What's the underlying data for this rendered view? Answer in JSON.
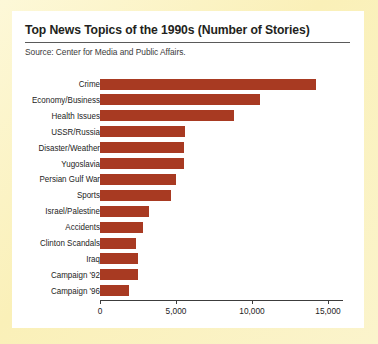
{
  "card": {
    "title": "Top News Topics of the 1990s (Number of Stories)",
    "source": "Source: Center for Media and Public Affairs.",
    "background_color": "#ffffff",
    "page_background_color": "#fbf3c4"
  },
  "chart_data": {
    "type": "bar",
    "orientation": "horizontal",
    "title": "Top News Topics of the 1990s (Number of Stories)",
    "subtitle": "Source: Center for Media and Public Affairs.",
    "xlabel": "",
    "ylabel": "",
    "xlim": [
      0,
      16500
    ],
    "grid": false,
    "legend": null,
    "bar_color": "#a83a22",
    "axis_ticks": [
      0,
      5000,
      10000,
      15000
    ],
    "axis_tick_labels": [
      "0",
      "5,000",
      "10,000",
      "15,000"
    ],
    "categories": [
      "Crime",
      "Economy/Business",
      "Health Issues",
      "USSR/Russia",
      "Disaster/Weather",
      "Yugoslavia",
      "Persian Gulf War",
      "Sports",
      "Israel/Palestine",
      "Accidents",
      "Clinton Scandals",
      "Iraq",
      "Campaign '92",
      "Campaign '96"
    ],
    "values": [
      14200,
      10500,
      8800,
      5600,
      5500,
      5500,
      5000,
      4700,
      3200,
      2800,
      2400,
      2500,
      2500,
      1900
    ]
  }
}
